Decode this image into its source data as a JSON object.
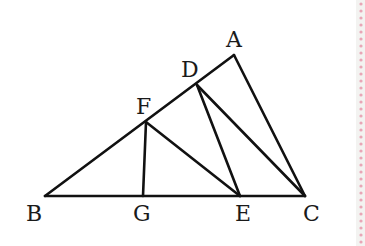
{
  "diagram": {
    "stroke_color": "#111111",
    "points": {
      "A": {
        "x": 234,
        "y": 55
      },
      "D": {
        "x": 197,
        "y": 85
      },
      "F": {
        "x": 146,
        "y": 122
      },
      "B": {
        "x": 45,
        "y": 196
      },
      "G": {
        "x": 143,
        "y": 196
      },
      "E": {
        "x": 240,
        "y": 196
      },
      "C": {
        "x": 305,
        "y": 196
      }
    },
    "segments": [
      [
        "B",
        "A"
      ],
      [
        "A",
        "C"
      ],
      [
        "B",
        "C"
      ],
      [
        "F",
        "G"
      ],
      [
        "F",
        "E"
      ],
      [
        "D",
        "E"
      ],
      [
        "D",
        "C"
      ]
    ],
    "labels": {
      "A": "A",
      "D": "D",
      "F": "F",
      "B": "B",
      "G": "G",
      "E": "E",
      "C": "C"
    }
  },
  "margin_decoration": {
    "dot_color": "#e8a6b6",
    "x": 361
  }
}
